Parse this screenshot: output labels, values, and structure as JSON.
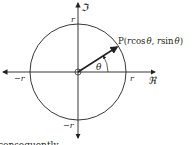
{
  "diagram": {
    "type": "unit-circle-polar",
    "axes": {
      "real_label": "ℜ",
      "imag_label": "ℑ"
    },
    "tick_labels": {
      "right": "r",
      "left": "−r",
      "top": "r",
      "bottom": "−r"
    },
    "point_label": "P(rcos θ, rsin θ)",
    "point_label_parts": {
      "p": "P(",
      "r1": "r",
      "cos": "cos",
      "theta1": "θ",
      "sep": ", ",
      "r2": "r",
      "sin": "sin",
      "theta2": "θ",
      "close": ")"
    },
    "angle_label": "θ",
    "footer_text": "consequently"
  }
}
